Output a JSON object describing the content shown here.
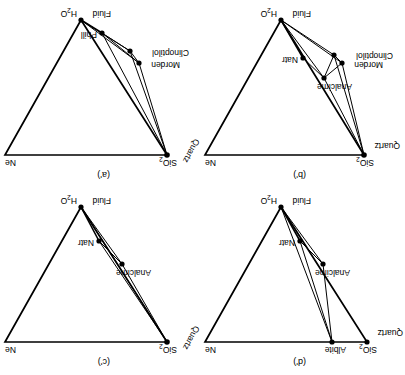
{
  "figure": {
    "type": "ternary-phase-diagram-grid",
    "rows": 2,
    "cols": 2,
    "orientation": "rotated-180",
    "note_axes": [
      "SiO2",
      "Ne",
      "H2O"
    ]
  },
  "panels": [
    {
      "id": "d",
      "tag": "(d')",
      "grid_position": "top-left",
      "apex_left_label": "SiO",
      "apex_left_sub": "2",
      "apex_left_secondary": "Quartz",
      "apex_right_label": "Ne",
      "apex_bottom_label_left": "Fluid",
      "apex_bottom_label_right": "H",
      "apex_bottom_sub": "2",
      "apex_bottom_tail": "O",
      "points": [
        {
          "name": "Albite",
          "x": 73,
          "y": 8
        },
        {
          "name": "Analcime",
          "x": 82,
          "y": 78
        },
        {
          "name": "Natr",
          "x": 105,
          "y": 101
        }
      ]
    },
    {
      "id": "c",
      "tag": "(c')",
      "grid_position": "top-right",
      "apex_left_label": "SiO",
      "apex_left_sub": "2",
      "apex_left_secondary": "Quartz",
      "apex_right_label": "Ne",
      "apex_bottom_label_left": "Fluid",
      "apex_bottom_label_right": "H",
      "apex_bottom_sub": "2",
      "apex_bottom_tail": "O",
      "points": [
        {
          "name": "Analcime",
          "x": 81,
          "y": 78
        },
        {
          "name": "Natr",
          "x": 104,
          "y": 101
        }
      ]
    },
    {
      "id": "b",
      "tag": "(b')",
      "grid_position": "bottom-left",
      "apex_left_label": "SiO",
      "apex_left_sub": "2",
      "apex_left_secondary": "Quartz",
      "apex_right_label": "Ne",
      "apex_bottom_label_left": "Fluid",
      "apex_bottom_label_right": "H",
      "apex_bottom_sub": "2",
      "apex_bottom_tail": "O",
      "points": [
        {
          "name": "Analcime",
          "x": 81,
          "y": 77
        },
        {
          "name": "Morden",
          "x": 63,
          "y": 92
        },
        {
          "name": "Clinoptilol",
          "x": 71,
          "y": 100
        },
        {
          "name": "Natr",
          "x": 102,
          "y": 97
        }
      ]
    },
    {
      "id": "a",
      "tag": "(a')",
      "grid_position": "bottom-right",
      "apex_left_label": "SiO",
      "apex_left_sub": "2",
      "apex_left_secondary": "Quartz",
      "apex_right_label": "Ne",
      "apex_bottom_label_left": "Fluid",
      "apex_bottom_label_right": "H",
      "apex_bottom_sub": "2",
      "apex_bottom_tail": "O",
      "points": [
        {
          "name": "Morden",
          "x": 64,
          "y": 92
        },
        {
          "name": "Clinoptilol",
          "x": 73,
          "y": 104
        },
        {
          "name": "Phill",
          "x": 101,
          "y": 122
        }
      ]
    }
  ],
  "style": {
    "line_color": "#000000",
    "point_color": "#000000",
    "background": "#ffffff"
  }
}
